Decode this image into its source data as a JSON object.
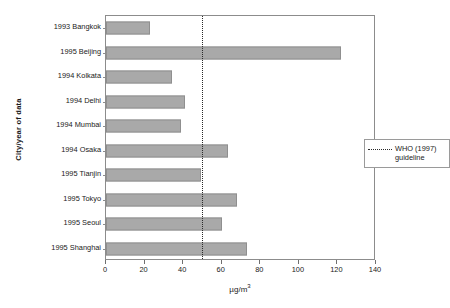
{
  "chart_data": {
    "type": "bar",
    "orientation": "horizontal",
    "title": "",
    "xlabel": "µg/m³",
    "ylabel": "City/year of data",
    "categories": [
      "1993 Bangkok",
      "1995 Beijing",
      "1994 Kolkata",
      "1994 Delhi",
      "1994 Mumbai",
      "1994 Osaka",
      "1995 Tianjin",
      "1995 Tokyo",
      "1995 Seoul",
      "1995 Shanghai"
    ],
    "values": [
      23,
      122,
      34,
      41,
      39,
      63,
      49,
      68,
      60,
      73
    ],
    "xlim": [
      0,
      140
    ],
    "xticks": [
      0,
      20,
      40,
      60,
      80,
      100,
      120,
      140
    ],
    "grid": false,
    "bar_color": "#a9a9a9",
    "bar_edge_color": "#8f8f8f",
    "annotations": [
      {
        "name": "who-guideline",
        "value": 50,
        "label": "WHO (1997) guideline",
        "style": "dotted-vertical",
        "color": "#2a2a2a"
      }
    ],
    "legend": {
      "position": "center-right-inside",
      "entries": [
        {
          "label_line1": "WHO (1997)",
          "label_line2": "guideline",
          "marker": "dotted-line"
        }
      ]
    }
  },
  "axis": {
    "x_title_main": "µg/m",
    "x_title_sup": "3",
    "y_title": "City/year of data",
    "x_tick_labels": [
      "0",
      "20",
      "40",
      "60",
      "80",
      "100",
      "120",
      "140"
    ]
  },
  "legend": {
    "line1": "WHO (1997)",
    "line2": "guideline"
  }
}
